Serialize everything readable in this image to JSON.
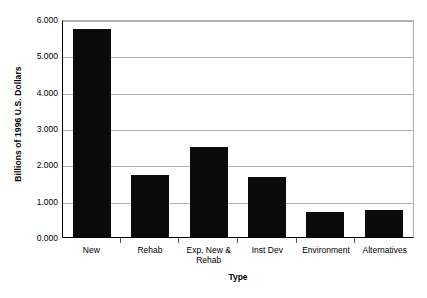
{
  "chart_data": {
    "type": "bar",
    "title": "",
    "xlabel": "Type",
    "ylabel": "Billions of 1996 U.S. Dollars",
    "categories": [
      "New",
      "Rehab",
      "Exp, New & Rehab",
      "Inst Dev",
      "Environment",
      "Alternatives"
    ],
    "category_lines": [
      [
        "New"
      ],
      [
        "Rehab"
      ],
      [
        "Exp, New &",
        "Rehab"
      ],
      [
        "Inst Dev"
      ],
      [
        "Environment"
      ],
      [
        "Alternatives"
      ]
    ],
    "values": [
      5.72,
      1.7,
      2.47,
      1.65,
      0.69,
      0.75
    ],
    "ylim": [
      0.0,
      6.0
    ],
    "yticks": [
      0.0,
      1.0,
      2.0,
      3.0,
      4.0,
      5.0,
      6.0
    ],
    "ytick_labels": [
      "0.000",
      "1.000",
      "2.000",
      "3.000",
      "4.000",
      "5.000",
      "6.000"
    ],
    "grid": true,
    "grid_axis": "y",
    "legend": false,
    "bar_color": "#0a0a0a",
    "grid_color": "#b3b3b3",
    "axis_color": "#000000",
    "background": "#ffffff"
  }
}
